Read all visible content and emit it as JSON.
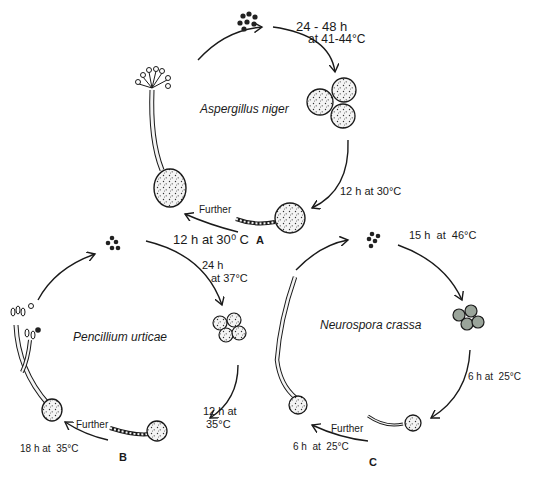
{
  "diagram": {
    "type": "fungal spore germination life cycles",
    "panels": [
      {
        "id": "A",
        "species": "Aspergillus niger",
        "steps": [
          {
            "label_line1": "24 - 48 h",
            "label_line2": "at 41-44°C"
          },
          {
            "label": "12 h at 30°C"
          },
          {
            "further": "Further",
            "label": "12 h at 30⁰ C"
          }
        ]
      },
      {
        "id": "B",
        "species": "Pencillium urticae",
        "steps": [
          {
            "label_line1": "24 h",
            "label_line2": "at 37°C"
          },
          {
            "label_line1": "12 h at",
            "label_line2": "35°C"
          },
          {
            "further": "Further",
            "label": "18 h at  35°C"
          }
        ]
      },
      {
        "id": "C",
        "species": "Neurospora crassa",
        "steps": [
          {
            "label": "15 h  at  46°C"
          },
          {
            "label": "6 h at  25°C"
          },
          {
            "further": "Further",
            "label": "6 h  at  25°C"
          }
        ]
      }
    ]
  }
}
